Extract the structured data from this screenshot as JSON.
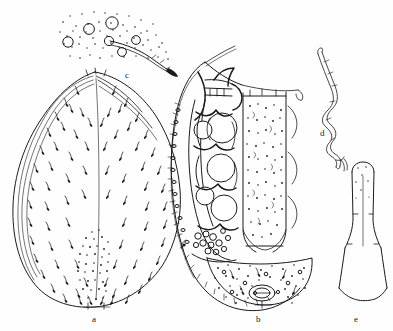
{
  "plate": {
    "kind": "scientific-illustration",
    "subject": "mite morphology plate (line drawing, ink stipple)",
    "background_color": "#fefefe",
    "ink_color": "#1a1a1a",
    "width": 393,
    "height": 331,
    "panel_count": 5
  },
  "labels": {
    "a": "a",
    "b": "b",
    "c": "c",
    "d": "d",
    "e": "e"
  },
  "panels": [
    {
      "id": "a",
      "label": "a",
      "label_x": 95,
      "label_y": 317,
      "caption_text": "a",
      "description": "dorsal habitus, ovoid body outline with striated margin and numerous short barbed setae; stippled median field near posterior",
      "bbox": [
        10,
        70,
        185,
        315
      ],
      "seta_count": 68,
      "stipple_patch": "posterior median"
    },
    {
      "id": "b",
      "label": "b",
      "label_x": 258,
      "label_y": 317,
      "caption_text": "b",
      "description": "ventral / internal view showing ovoid body with beaded lateral margin, internal rounded ova, central stippled longitudinal column, lateral arcs and posterior stippled plate with small genital opening",
      "bbox": [
        168,
        55,
        310,
        315
      ],
      "ova_count": 5,
      "lateral_arc_count": 3
    },
    {
      "id": "c",
      "label": "c",
      "label_x": 127,
      "label_y": 75,
      "caption_text": "c",
      "description": "enlarged detail of cuticle: scattered open circles (pores) within a stippled field, with a curved tapering seta bearing small rings",
      "bbox": [
        55,
        5,
        180,
        75
      ],
      "circle_count": 7
    },
    {
      "id": "d",
      "label": "d",
      "label_x": 322,
      "label_y": 133,
      "caption_text": "d",
      "description": "slender zig-zag sinuous appendage, tapering at both ends, drawn in double outline",
      "bbox": [
        308,
        50,
        365,
        165
      ]
    },
    {
      "id": "e",
      "label": "e",
      "label_x": 356,
      "label_y": 319,
      "caption_text": "e",
      "description": "elongate club / funnel-shaped structure: narrow rounded shaft widening to a flared triangular base with concave lower edge",
      "bbox": [
        330,
        155,
        390,
        315
      ]
    }
  ]
}
